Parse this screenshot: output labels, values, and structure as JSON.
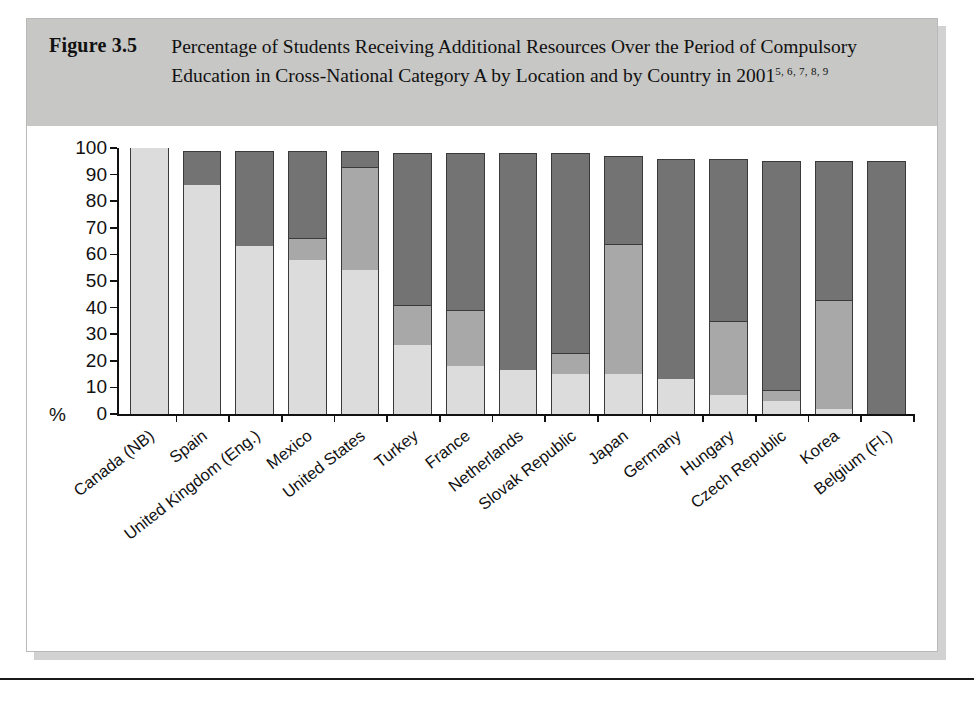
{
  "figure": {
    "number_label": "Figure 3.5",
    "title_line1": "Percentage of Students Receiving Additional Resources Over the",
    "title_line2": "Period of Compulsory Education in Cross-National Category A by",
    "title_line3": "Location and by Country in 2001",
    "title_superscript": "5, 6, 7, 8, 9"
  },
  "legend": {
    "items": [
      {
        "label": "Regular classes",
        "color": "#dcdcdc",
        "key": "regular"
      },
      {
        "label": "Special classes",
        "color": "#a8a8a8",
        "key": "special_classes"
      },
      {
        "label": "Special schools",
        "color": "#737373",
        "key": "special_schools"
      }
    ]
  },
  "chart_data": {
    "type": "bar",
    "stacked": true,
    "title": "Percentage of Students Receiving Additional Resources Over the Period of Compulsory Education in Cross-National Category A by Location and by Country in 2001",
    "xlabel": "",
    "ylabel": "%",
    "ylim": [
      0,
      100
    ],
    "yticks": [
      0,
      10,
      20,
      30,
      40,
      50,
      60,
      70,
      80,
      90,
      100
    ],
    "ytick_labels": [
      "0",
      "10",
      "20",
      "30",
      "40",
      "50",
      "60",
      "70",
      "80",
      "90",
      "100"
    ],
    "grid": false,
    "legend_position": "bottom",
    "categories": [
      "Canada (NB)",
      "Spain",
      "United Kingdom (Eng.)",
      "Mexico",
      "United States",
      "Turkey",
      "France",
      "Netherlands",
      "Slovak Republic",
      "Japan",
      "Germany",
      "Hungary",
      "Czech Republic",
      "Korea",
      "Belgium (Fl.)"
    ],
    "series": [
      {
        "name": "Regular classes",
        "color": "#dcdcdc",
        "values": [
          100,
          86,
          63,
          58,
          54,
          26,
          18,
          16.5,
          15,
          15,
          13,
          7,
          5,
          2,
          0
        ]
      },
      {
        "name": "Special classes",
        "color": "#a8a8a8",
        "values": [
          0,
          0,
          0,
          8,
          39,
          15,
          21,
          0,
          8,
          49,
          0,
          28,
          4,
          41,
          0
        ]
      },
      {
        "name": "Special schools",
        "color": "#737373",
        "values": [
          0,
          13,
          36,
          33,
          6,
          57,
          59,
          81.5,
          75,
          33,
          83,
          61,
          86,
          52,
          95
        ]
      }
    ],
    "cumulative_tops": [
      [
        100,
        100,
        100
      ],
      [
        86,
        86,
        99
      ],
      [
        63,
        63,
        99
      ],
      [
        58,
        66,
        99
      ],
      [
        54,
        93,
        99
      ],
      [
        26,
        41,
        98
      ],
      [
        18,
        39,
        98
      ],
      [
        16.5,
        16.5,
        98
      ],
      [
        15,
        23,
        98
      ],
      [
        15,
        64,
        97
      ],
      [
        13,
        13,
        96
      ],
      [
        7,
        35,
        96
      ],
      [
        5,
        9,
        95
      ],
      [
        2,
        43,
        95
      ],
      [
        0,
        0,
        95
      ]
    ]
  }
}
